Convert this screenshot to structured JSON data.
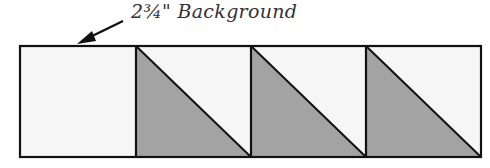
{
  "diagram": {
    "label": "2¾\" Background",
    "colors": {
      "background_fabric": "#f6f6f6",
      "shaded_fabric": "#a3a3a3",
      "outline": "#111111"
    },
    "blocks": [
      {
        "type": "plain-square",
        "fabric": "background"
      },
      {
        "type": "half-square-triangle",
        "shaded": "lower-left"
      },
      {
        "type": "half-square-triangle",
        "shaded": "lower-left"
      },
      {
        "type": "half-square-triangle",
        "shaded": "lower-left"
      }
    ]
  }
}
